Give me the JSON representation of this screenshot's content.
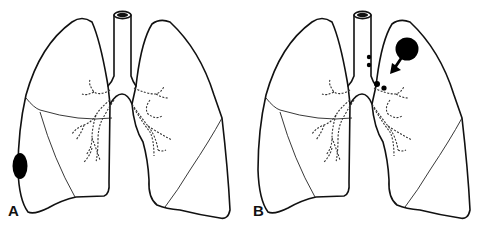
{
  "figure": {
    "panels": [
      {
        "label": "A",
        "description": "Lungs with peripheral nodule at right lateral pleural surface",
        "lesions": [
          {
            "type": "peripheral-nodule",
            "location": "right lung, lateral lower zone"
          }
        ]
      },
      {
        "label": "B",
        "description": "Lungs with left upper lobe mass and hilar/mediastinal lymph nodes, arrow indicating spread toward hilum",
        "lesions": [
          {
            "type": "mass",
            "location": "left upper lobe"
          },
          {
            "type": "lymph-nodes",
            "location": "paratracheal and hilar"
          },
          {
            "type": "arrow",
            "direction": "toward hilum"
          }
        ]
      }
    ],
    "colors": {
      "line": "#111111",
      "lesion": "#000000",
      "background": "#ffffff"
    }
  }
}
